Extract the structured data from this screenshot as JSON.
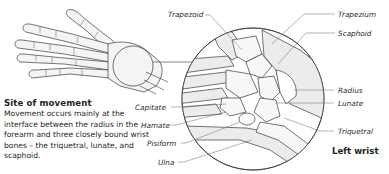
{
  "caption": {
    "title": "Site of movement",
    "body": "Movement occurs mainly at the interface between the radius in the forearm and three closely bound wrist bones – the triquetral, lunate, and scaphoid."
  },
  "view_title": "Left wrist",
  "labels": {
    "trapezoid": "Trapezoid",
    "trapezium": "Trapezium",
    "scaphoid": "Scaphoid",
    "radius": "Radius",
    "lunate": "Lunate",
    "triquetral": "Triquetral",
    "capitate": "Capitate",
    "hamate": "Hamate",
    "pisiform": "Pisiform",
    "ulna": "Ulna"
  },
  "colors": {
    "line": "#3a3a3a",
    "bone_fill": "#ececec",
    "leader": "#6a6a6a"
  }
}
